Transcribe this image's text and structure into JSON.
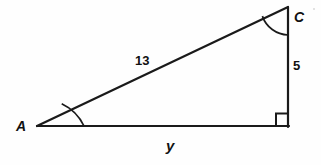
{
  "figure": {
    "kind": "geometry-diagram",
    "shape": "right-triangle",
    "background_color": "#fefefe",
    "stroke_color": "#1a1a1a",
    "stroke_width": 2,
    "canvas": {
      "width": 321,
      "height": 165
    }
  },
  "vertices": {
    "a": {
      "label": "A",
      "x": 37,
      "y": 126,
      "marked_angle": true
    },
    "b": {
      "label": "",
      "x": 288,
      "y": 126,
      "marked_angle": true,
      "right_angle": true
    },
    "c": {
      "label": "C",
      "x": 288,
      "y": 7,
      "marked_angle": true
    }
  },
  "sides": {
    "hypotenuse": {
      "label": "13",
      "from": "a",
      "to": "c"
    },
    "vertical": {
      "label": "5",
      "from": "c",
      "to": "b"
    },
    "base": {
      "label": "y",
      "from": "a",
      "to": "b"
    }
  },
  "labels": {
    "vertex_a": "A",
    "vertex_c": "C",
    "side_hypotenuse": "13",
    "side_vertical": "5",
    "side_base": "y"
  },
  "markers": {
    "right_angle_square": {
      "at": "b",
      "size": 12
    },
    "angle_arc_a": {
      "at": "a",
      "radius": 47
    },
    "angle_arc_c": {
      "at": "c",
      "radius": 28
    }
  }
}
